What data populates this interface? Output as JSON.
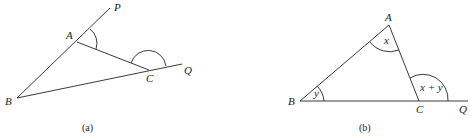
{
  "figure_a": {
    "caption": "(a)",
    "labels": {
      "P": "P",
      "A": "A",
      "C": "C",
      "Q": "Q",
      "B": "B"
    }
  },
  "figure_b": {
    "caption": "(b)",
    "labels": {
      "A": "A",
      "B": "B",
      "C": "C",
      "Q": "Q"
    },
    "angles": {
      "at_A": "x",
      "at_B": "y",
      "exterior_C": "x + y"
    }
  },
  "colors": {
    "stroke": "#3a3a3a",
    "text": "#222222",
    "background": "#ffffff"
  }
}
